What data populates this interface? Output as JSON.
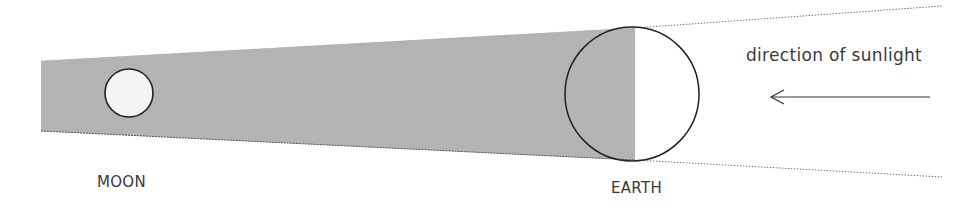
{
  "diagram": {
    "type": "lunar-eclipse-shadow",
    "labels": {
      "moon": "MOON",
      "earth": "EARTH",
      "sunlight": "direction of sunlight"
    },
    "colors": {
      "shadow": "#9a9a9a",
      "outline": "#222222",
      "text": "#3a3a3a",
      "background": "#ffffff"
    },
    "arrow": {
      "direction": "left"
    }
  }
}
